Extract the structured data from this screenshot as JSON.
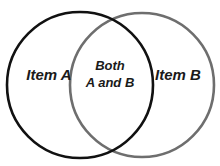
{
  "diagram": {
    "type": "venn",
    "sets": [
      {
        "id": "A",
        "label": "Item A",
        "stroke": "#111111"
      },
      {
        "id": "B",
        "label": "Item B",
        "stroke": "#6e6e6e"
      }
    ],
    "intersection": {
      "line1": "Both",
      "line2": "A and B"
    }
  }
}
